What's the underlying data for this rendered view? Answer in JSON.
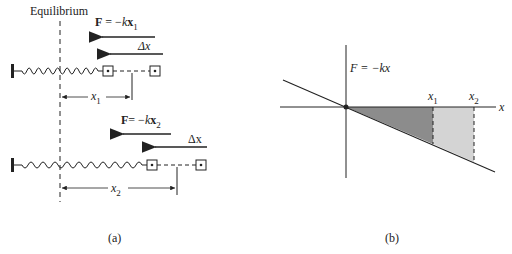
{
  "panel_a": {
    "equilibrium_label": "Equilibrium",
    "row1": {
      "force_label_prefix": "F",
      "force_label_eq": " = −",
      "force_label_k": "k",
      "force_label_x": "x",
      "force_label_sub": "1",
      "delta_label": "Δx",
      "disp_label": "x",
      "disp_sub": "1"
    },
    "row2": {
      "force_label_prefix": "F",
      "force_label_eq": "= −",
      "force_label_k": "k",
      "force_label_x": "x",
      "force_label_sub": "2",
      "delta_label": "Δx",
      "disp_label": "x",
      "disp_sub": "2"
    },
    "caption": "(a)"
  },
  "panel_b": {
    "function_label": "F = −kx",
    "x1_label": "x",
    "x1_sub": "1",
    "x2_label": "x",
    "x2_sub": "2",
    "axis_label": "x",
    "caption": "(b)",
    "colors": {
      "dark_fill": "#8c8c8c",
      "light_fill": "#d4d4d4",
      "line": "#222222"
    }
  }
}
